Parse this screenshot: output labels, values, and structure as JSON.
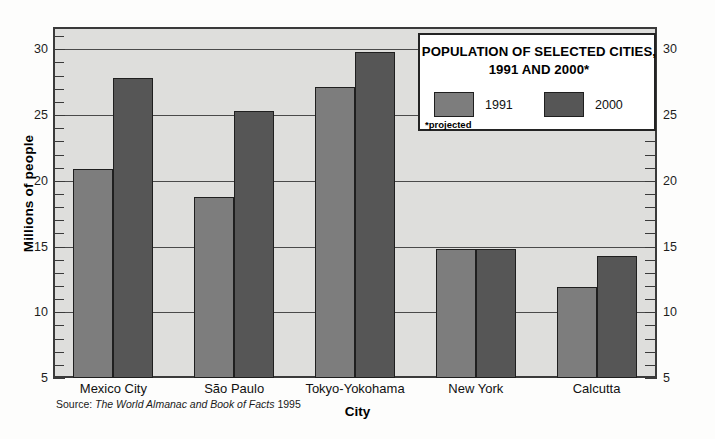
{
  "chart_data": {
    "type": "bar",
    "title": "POPULATION OF SELECTED CITIES, 1991 AND 2000*",
    "title_line1": "POPULATION OF SELECTED CITIES,",
    "title_line2": "1991 AND 2000*",
    "xlabel": "City",
    "ylabel": "Millions of people",
    "categories": [
      "Mexico City",
      "São Paulo",
      "Tokyo-Yokohama",
      "New York",
      "Calcutta"
    ],
    "series": [
      {
        "name": "1991",
        "color": "#7d7d7d",
        "values": [
          20.9,
          18.8,
          27.1,
          14.8,
          11.9
        ]
      },
      {
        "name": "2000",
        "color": "#565656",
        "values": [
          27.8,
          25.3,
          29.8,
          14.8,
          14.3
        ]
      }
    ],
    "ylim": [
      5,
      31.7
    ],
    "ytick_labels": [
      "30",
      "25",
      "20",
      "15",
      "10",
      "5"
    ],
    "ytick_values": [
      30,
      25,
      20,
      15,
      10,
      5
    ],
    "minor_tick_interval": 1,
    "grid": true,
    "grid_axis": "y",
    "legend_position": "top-right",
    "footnote": "*projected",
    "source_prefix": "Source:",
    "source_title": "The World Almanac and Book of Facts",
    "source_year": "1995"
  }
}
